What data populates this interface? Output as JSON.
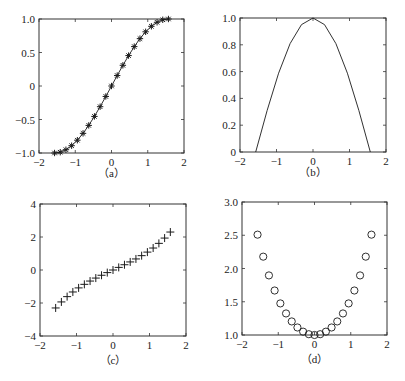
{
  "chart_data": [
    {
      "id": "a",
      "type": "line",
      "caption": "（a）",
      "title": "",
      "xlabel": "",
      "ylabel": "",
      "marker": "asterisk",
      "line": true,
      "xlim": [
        -2,
        2
      ],
      "ylim": [
        -1.0,
        1.0
      ],
      "xticks": [
        -2,
        -1,
        0,
        1,
        2
      ],
      "xtick_labels": [
        "−2",
        "−1",
        "0",
        "1",
        "2"
      ],
      "yticks": [
        -1.0,
        -0.5,
        0,
        0.5,
        1.0
      ],
      "ytick_labels": [
        "−1.0",
        "−0.5",
        "0",
        "0.5",
        "1.0"
      ],
      "grid": false,
      "x": [
        -1.571,
        -1.414,
        -1.257,
        -1.1,
        -0.942,
        -0.785,
        -0.628,
        -0.471,
        -0.314,
        -0.157,
        0,
        0.157,
        0.314,
        0.471,
        0.628,
        0.785,
        0.942,
        1.1,
        1.257,
        1.414,
        1.571
      ],
      "y": [
        -1.0,
        -0.988,
        -0.951,
        -0.891,
        -0.809,
        -0.707,
        -0.588,
        -0.454,
        -0.309,
        -0.156,
        0,
        0.156,
        0.309,
        0.454,
        0.588,
        0.707,
        0.809,
        0.891,
        0.951,
        0.988,
        1.0
      ]
    },
    {
      "id": "b",
      "type": "line",
      "caption": "（b）",
      "title": "",
      "xlabel": "",
      "ylabel": "",
      "marker": "none",
      "line": true,
      "xlim": [
        -2,
        2
      ],
      "ylim": [
        0,
        1.0
      ],
      "xticks": [
        -2,
        -1,
        0,
        1,
        2
      ],
      "xtick_labels": [
        "−2",
        "−1",
        "0",
        "1",
        "2"
      ],
      "yticks": [
        0,
        0.2,
        0.4,
        0.6,
        0.8,
        1.0
      ],
      "ytick_labels": [
        "0",
        "0.2",
        "0.4",
        "0.6",
        "0.8",
        "1.0"
      ],
      "grid": false,
      "x": [
        -1.571,
        -1.257,
        -0.942,
        -0.628,
        -0.314,
        0,
        0.314,
        0.628,
        0.942,
        1.257,
        1.571
      ],
      "y": [
        0.0,
        0.309,
        0.588,
        0.809,
        0.951,
        1.0,
        0.951,
        0.809,
        0.588,
        0.309,
        0.0
      ]
    },
    {
      "id": "c",
      "type": "scatter",
      "caption": "（c）",
      "title": "",
      "xlabel": "",
      "ylabel": "",
      "marker": "plus",
      "line": false,
      "xlim": [
        -2,
        2
      ],
      "ylim": [
        -4,
        4
      ],
      "xticks": [
        -2,
        -1,
        0,
        1,
        2
      ],
      "xtick_labels": [
        "−2",
        "−1",
        "0",
        "1",
        "2"
      ],
      "yticks": [
        -4,
        -2,
        0,
        2,
        4
      ],
      "ytick_labels": [
        "−4",
        "−2",
        "0",
        "2",
        "4"
      ],
      "grid": false,
      "x": [
        -1.571,
        -1.414,
        -1.257,
        -1.1,
        -0.942,
        -0.785,
        -0.628,
        -0.471,
        -0.314,
        -0.157,
        0,
        0.157,
        0.314,
        0.471,
        0.628,
        0.785,
        0.942,
        1.1,
        1.257,
        1.414,
        1.571
      ],
      "y": [
        -2.301,
        -1.935,
        -1.614,
        -1.332,
        -1.085,
        -0.869,
        -0.67,
        -0.489,
        -0.319,
        -0.158,
        0,
        0.158,
        0.319,
        0.489,
        0.67,
        0.869,
        1.085,
        1.332,
        1.614,
        1.935,
        2.301
      ]
    },
    {
      "id": "d",
      "type": "scatter",
      "caption": "（d）",
      "title": "",
      "xlabel": "",
      "ylabel": "",
      "marker": "circle",
      "line": false,
      "xlim": [
        -2,
        2
      ],
      "ylim": [
        1.0,
        3.0
      ],
      "xticks": [
        -2,
        -1,
        0,
        1,
        2
      ],
      "xtick_labels": [
        "−2",
        "−1",
        "0",
        "1",
        "2"
      ],
      "yticks": [
        1.0,
        1.5,
        2.0,
        2.5,
        3.0
      ],
      "ytick_labels": [
        "1.0",
        "1.5",
        "2.0",
        "2.5",
        "3.0"
      ],
      "grid": false,
      "x": [
        -1.571,
        -1.414,
        -1.257,
        -1.1,
        -0.942,
        -0.785,
        -0.628,
        -0.471,
        -0.314,
        -0.157,
        0,
        0.157,
        0.314,
        0.471,
        0.628,
        0.785,
        0.942,
        1.1,
        1.257,
        1.414,
        1.571
      ],
      "y": [
        2.509,
        2.178,
        1.896,
        1.669,
        1.475,
        1.324,
        1.204,
        1.113,
        1.05,
        1.012,
        1.0,
        1.012,
        1.05,
        1.113,
        1.204,
        1.324,
        1.475,
        1.669,
        1.896,
        2.178,
        2.509
      ]
    }
  ],
  "layout": {
    "panels": [
      {
        "left": 39,
        "top": 19,
        "right": 184,
        "bottom": 153,
        "caption_y": 177
      },
      {
        "left": 240,
        "top": 18,
        "right": 386,
        "bottom": 152,
        "caption_y": 176
      },
      {
        "left": 40,
        "top": 204,
        "right": 186,
        "bottom": 336,
        "caption_y": 364
      },
      {
        "left": 242,
        "top": 202,
        "right": 387,
        "bottom": 335,
        "caption_y": 363
      }
    ],
    "axis_color": "#333333",
    "marker_color": "#1a1a1a"
  }
}
